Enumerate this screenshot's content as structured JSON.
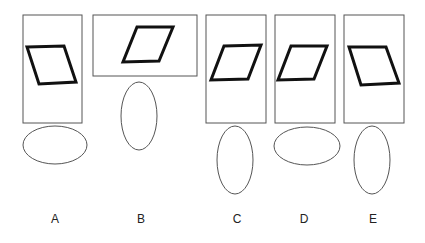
{
  "options": [
    {
      "label": "A",
      "rect": [
        23,
        15,
        59,
        108
      ],
      "para": [
        [
          27,
          47
        ],
        [
          64,
          46
        ],
        [
          76,
          82
        ],
        [
          39,
          84
        ]
      ],
      "ellipse": [
        55,
        145,
        32,
        19
      ],
      "label_x": 55
    },
    {
      "label": "B",
      "rect": [
        93,
        15,
        104,
        61
      ],
      "para": [
        [
          137,
          27
        ],
        [
          173,
          27
        ],
        [
          159,
          61
        ],
        [
          123,
          62
        ]
      ],
      "ellipse": [
        139,
        116,
        18,
        34
      ],
      "label_x": 141
    },
    {
      "label": "C",
      "rect": [
        206,
        15,
        60,
        108
      ],
      "para": [
        [
          224,
          46
        ],
        [
          261,
          45
        ],
        [
          248,
          79
        ],
        [
          211,
          80
        ]
      ],
      "ellipse": [
        235,
        160,
        18,
        34
      ],
      "label_x": 237
    },
    {
      "label": "D",
      "rect": [
        275,
        15,
        60,
        108
      ],
      "para": [
        [
          291,
          46
        ],
        [
          327,
          46
        ],
        [
          314,
          79
        ],
        [
          278,
          80
        ]
      ],
      "ellipse": [
        307,
        146,
        33,
        19
      ],
      "label_x": 304
    },
    {
      "label": "E",
      "rect": [
        344,
        15,
        60,
        108
      ],
      "para": [
        [
          349,
          47
        ],
        [
          386,
          47
        ],
        [
          399,
          83
        ],
        [
          361,
          85
        ]
      ],
      "ellipse": [
        372,
        160,
        18,
        34
      ],
      "label_x": 373
    }
  ],
  "colors": {
    "rect_stroke": "#555555",
    "para_stroke": "#111111",
    "ellipse_stroke": "#555555"
  }
}
